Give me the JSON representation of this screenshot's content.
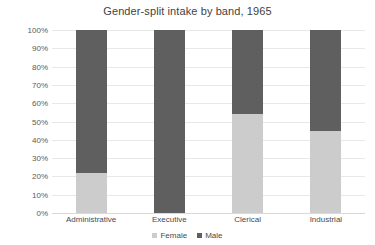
{
  "chart_data": {
    "type": "bar",
    "subtype": "stacked-100-percent",
    "title": "Gender-split intake by band, 1965",
    "subtitle": "",
    "xlabel": "",
    "ylabel": "",
    "categories": [
      "Administrative",
      "Executive",
      "Clerical",
      "Industrial"
    ],
    "series": [
      {
        "name": "Female",
        "color": "#cccccc",
        "values": [
          22,
          0,
          54,
          45
        ]
      },
      {
        "name": "Male",
        "color": "#5f5f5f",
        "values": [
          78,
          100,
          46,
          55
        ]
      }
    ],
    "ylim": [
      0,
      100
    ],
    "y_tick_values": [
      0,
      10,
      20,
      30,
      40,
      50,
      60,
      70,
      80,
      90,
      100
    ],
    "y_tick_labels": [
      "0%",
      "10%",
      "20%",
      "30%",
      "40%",
      "50%",
      "60%",
      "70%",
      "80%",
      "90%",
      "100%"
    ],
    "grid": true,
    "grid_axis": "y",
    "grid_color": "#e8e8e8",
    "legend": true,
    "legend_position": "bottom",
    "legend_entries": [
      "Female",
      "Male"
    ],
    "value_unit": "%",
    "background_color": "#ffffff",
    "title_color": "#3f3f3f",
    "axis_label_color": "#4a4a4a"
  }
}
